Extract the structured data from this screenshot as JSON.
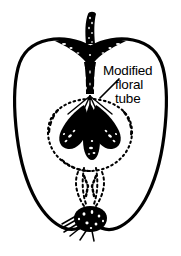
{
  "page": {
    "header_mark": "",
    "background_color": "#ffffff",
    "ink_color": "#000000"
  },
  "figure": {
    "name": "apple-longitudinal-section",
    "caption_label": {
      "line_1": "Modified",
      "line_2": "floral",
      "line_3": "tube"
    },
    "leader_line": {
      "name": "leader-line",
      "from_x": 101,
      "from_y": 97,
      "to_x": 118,
      "to_y": 80
    },
    "parts": [
      {
        "name": "fruit-outline",
        "style": "solid-thick-black"
      },
      {
        "name": "stem",
        "style": "solid-black-stippled"
      },
      {
        "name": "stem-cavity",
        "style": "filled-black-stippled"
      },
      {
        "name": "floral-tube-boundary",
        "style": "dashed-dotted"
      },
      {
        "name": "seed-left",
        "style": "filled-black"
      },
      {
        "name": "seed-center",
        "style": "filled-black"
      },
      {
        "name": "seed-right",
        "style": "filled-black"
      },
      {
        "name": "vascular-strands",
        "style": "dashed"
      },
      {
        "name": "calyx-remnant",
        "style": "filled-black-stippled"
      },
      {
        "name": "calyx-hairs",
        "style": "solid-black-lines"
      }
    ]
  }
}
